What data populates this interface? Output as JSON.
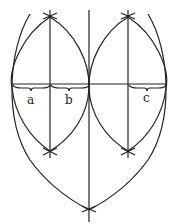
{
  "diagram": {
    "labels": {
      "a": "a",
      "b": "b",
      "c": "c"
    },
    "colors": {
      "line": "#222222",
      "background": "#ffffff"
    }
  }
}
